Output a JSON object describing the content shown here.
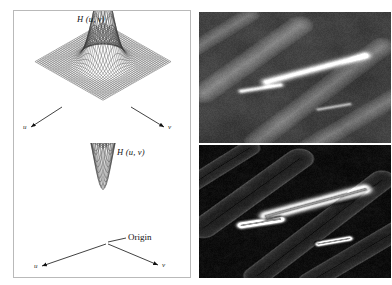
{
  "figure": {
    "panels": {
      "lowpass_plot": {
        "function_label": "H (u, v)",
        "axis_left_label": "u",
        "axis_right_label": "v"
      },
      "highpass_plot": {
        "function_label": "H (u, v)",
        "axis_left_label": "u",
        "axis_right_label": "v",
        "origin_label": "Origin"
      },
      "lowpass_image": {
        "caption": ""
      },
      "highpass_image": {
        "caption": ""
      }
    }
  },
  "chart_data": [
    {
      "type": "surface",
      "title": "H (u, v)",
      "subtitle": "Gaussian lowpass filter transfer function",
      "xlabel": "u",
      "ylabel": "v",
      "zlabel": "H",
      "grid": true,
      "legend": "none",
      "x": [
        -1.0,
        -0.8,
        -0.6,
        -0.4,
        -0.2,
        0.0,
        0.2,
        0.4,
        0.6,
        0.8,
        1.0
      ],
      "y": [
        -1.0,
        -0.8,
        -0.6,
        -0.4,
        -0.2,
        0.0,
        0.2,
        0.4,
        0.6,
        0.8,
        1.0
      ],
      "zlim": [
        0,
        1
      ],
      "peak_value": 1.0,
      "peak_at": [
        0,
        0
      ],
      "formula": "H(u,v) = exp(-(u^2+v^2)/(2*s^2))",
      "sigma": 0.22
    },
    {
      "type": "surface",
      "title": "H (u, v)",
      "subtitle": "Gaussian highpass filter transfer function",
      "xlabel": "u",
      "ylabel": "v",
      "zlabel": "H",
      "grid": true,
      "legend": "none",
      "x": [
        -1.0,
        -0.8,
        -0.6,
        -0.4,
        -0.2,
        0.0,
        0.2,
        0.4,
        0.6,
        0.8,
        1.0
      ],
      "y": [
        -1.0,
        -0.8,
        -0.6,
        -0.4,
        -0.2,
        0.0,
        0.2,
        0.4,
        0.6,
        0.8,
        1.0
      ],
      "zlim": [
        0,
        1
      ],
      "minimum_value": 0.0,
      "minimum_at": [
        0,
        0
      ],
      "annotation": "Origin",
      "formula": "H(u,v) = 1 - exp(-(u^2+v^2)/(2*s^2))",
      "sigma": 0.22
    },
    {
      "type": "image",
      "title": "",
      "description": "Blurred grayscale micrograph (result of lowpass filtering)",
      "colormap": "gray",
      "mean_intensity": 0.33
    },
    {
      "type": "image",
      "title": "",
      "description": "Dark edge image (result of highpass filtering)",
      "colormap": "gray",
      "mean_intensity": 0.06
    }
  ]
}
